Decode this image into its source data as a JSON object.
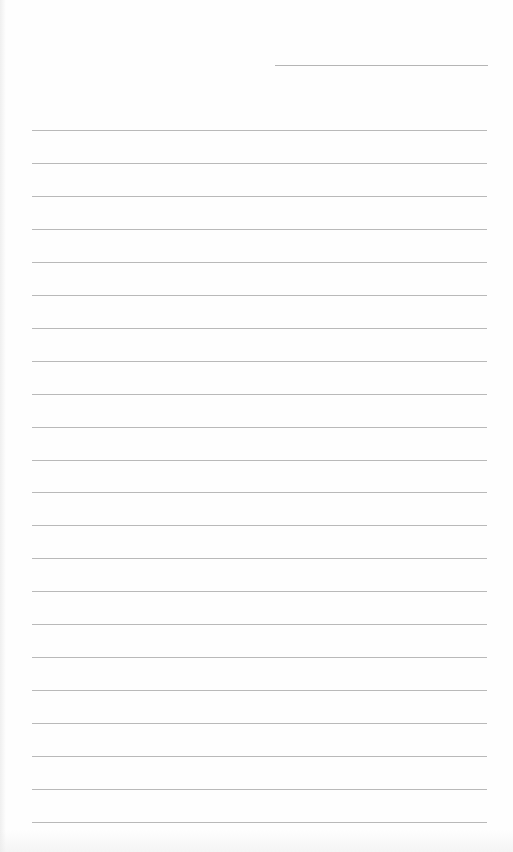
{
  "document": {
    "type": "lined-paper",
    "header_line": {
      "x": 275,
      "y": 65,
      "width": 213
    },
    "ruled_lines": {
      "count": 22,
      "start_y": 130,
      "spacing": 32.95,
      "left": 32,
      "right": 487,
      "color": "#b9b9b9"
    }
  }
}
